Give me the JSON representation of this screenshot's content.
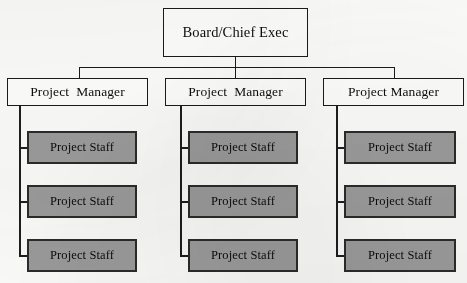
{
  "diagram": {
    "type": "organizational-chart",
    "background_color": "#fbfbf9",
    "colors": {
      "box_fill_light": "#fdfdfb",
      "box_fill_gray": "#9b9b9b",
      "border": "#1a1a1a",
      "staff_border": "#2b2b2b",
      "text": "#0d0d0d"
    },
    "root": {
      "label": "Board/Chief Exec"
    },
    "branches": [
      {
        "manager": {
          "word1": "Project",
          "word2": "Manager",
          "spacing": "wide"
        },
        "staff": [
          {
            "label": "Project Staff"
          },
          {
            "label": "Project Staff"
          },
          {
            "label": "Project Staff"
          }
        ]
      },
      {
        "manager": {
          "word1": "Project",
          "word2": "Manager",
          "spacing": "wide"
        },
        "staff": [
          {
            "label": "Project Staff"
          },
          {
            "label": "Project Staff"
          },
          {
            "label": "Project Staff"
          }
        ]
      },
      {
        "manager": {
          "word1": "Project",
          "word2": "Manager",
          "spacing": "narrow"
        },
        "staff": [
          {
            "label": "Project Staff"
          },
          {
            "label": "Project Staff"
          },
          {
            "label": "Project Staff"
          }
        ]
      }
    ]
  }
}
